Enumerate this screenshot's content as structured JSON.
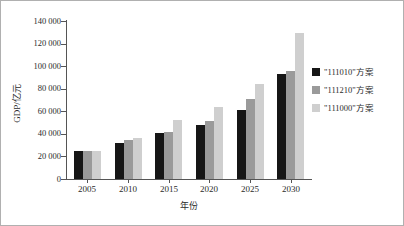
{
  "chart_data": {
    "type": "bar",
    "title": "",
    "xlabel": "年份",
    "ylabel": "GDP/亿元",
    "categories": [
      "2005",
      "2010",
      "2015",
      "2020",
      "2025",
      "2030"
    ],
    "series": [
      {
        "name": "\"111010\"方案",
        "color": "#161616",
        "values": [
          25000,
          31500,
          40500,
          47500,
          61500,
          93000
        ]
      },
      {
        "name": "\"111210\"方案",
        "color": "#9a9a9a",
        "values": [
          24500,
          34500,
          42000,
          51500,
          70500,
          95500
        ]
      },
      {
        "name": "\"111000\"方案",
        "color": "#cfcfcf",
        "values": [
          24500,
          36500,
          52500,
          64000,
          84000,
          129000
        ]
      }
    ],
    "ylim": [
      0,
      140000
    ],
    "ytick_values": [
      0,
      20000,
      40000,
      60000,
      80000,
      100000,
      120000,
      140000
    ],
    "ytick_labels": [
      "0",
      "20 000",
      "40 000",
      "60 000",
      "80 000",
      "100 000",
      "120 000",
      "140 000"
    ],
    "grid": false,
    "legend_position": "right"
  },
  "legend": {
    "entries": [
      {
        "label": "\"111010\"方案",
        "color": "#161616"
      },
      {
        "label": "\"111210\"方案",
        "color": "#9a9a9a"
      },
      {
        "label": "\"111000\"方案",
        "color": "#cfcfcf"
      }
    ]
  }
}
